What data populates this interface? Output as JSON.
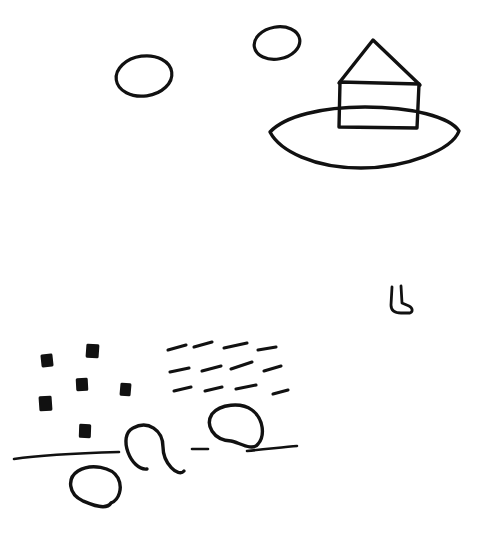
{
  "canvas": {
    "title": "Hand-drawn sketch",
    "width": 489,
    "height": 533,
    "background_color": "#ffffff",
    "ink_color": "#111111",
    "medium": "pencil-sketch"
  },
  "scene": {
    "description": "Rough pencil sketch: a house on an island-like oval in the upper right, two small clouds floating to its left, a small boot shape in the middle right, and a lower-left group of small filled squares, three rows of short dashes, three open circles and horizontal ground lines."
  },
  "shapes": {
    "cloud_left": {
      "name": "cloud-left",
      "cx": 144,
      "cy": 76,
      "rx": 28,
      "ry": 20,
      "rotate": -8,
      "stroke_width": 3.2
    },
    "cloud_right": {
      "name": "cloud-right",
      "cx": 277,
      "cy": 43,
      "rx": 23,
      "ry": 16,
      "rotate": -10,
      "stroke_width": 3.2
    },
    "island_oval": {
      "name": "island-oval",
      "path": "M 270 132 C 285 116 322 107 365 107 C 412 107 450 117 459 131 C 452 150 406 168 361 168 C 314 168 280 151 270 132 Z",
      "stroke_width": 3.4
    },
    "house_body": {
      "name": "house-body",
      "path": "M 340 82 L 419 84 L 417 128 L 339 127 Z",
      "stroke_width": 3.4
    },
    "house_roof": {
      "name": "house-roof",
      "path": "M 339 83 L 373 40 L 420 85",
      "stroke_width": 3.4
    },
    "boot": {
      "name": "boot-shape",
      "path": "M 392 287 L 391 305 C 391 311 395 313 401 313 L 410 313 C 413 312 413 308 409 306 L 402 303 L 401 286",
      "stroke_width": 2.8
    },
    "squares": [
      {
        "name": "square-1",
        "x": 41,
        "y": 354,
        "w": 12,
        "h": 13,
        "rotate": -6
      },
      {
        "name": "square-2",
        "x": 86,
        "y": 344,
        "w": 13,
        "h": 14,
        "rotate": 4
      },
      {
        "name": "square-3",
        "x": 76,
        "y": 378,
        "w": 12,
        "h": 13,
        "rotate": -3
      },
      {
        "name": "square-4",
        "x": 120,
        "y": 383,
        "w": 11,
        "h": 13,
        "rotate": 5
      },
      {
        "name": "square-5",
        "x": 39,
        "y": 396,
        "w": 13,
        "h": 15,
        "rotate": -4
      },
      {
        "name": "square-6",
        "x": 79,
        "y": 424,
        "w": 12,
        "h": 14,
        "rotate": 2
      }
    ],
    "dash_rows": [
      {
        "name": "dash-row-1",
        "dashes": [
          {
            "x1": 168,
            "y1": 350,
            "x2": 186,
            "y2": 345
          },
          {
            "x1": 194,
            "y1": 347,
            "x2": 212,
            "y2": 342
          },
          {
            "x1": 224,
            "y1": 348,
            "x2": 247,
            "y2": 343
          },
          {
            "x1": 258,
            "y1": 350,
            "x2": 276,
            "y2": 347
          }
        ]
      },
      {
        "name": "dash-row-2",
        "dashes": [
          {
            "x1": 170,
            "y1": 372,
            "x2": 189,
            "y2": 368
          },
          {
            "x1": 202,
            "y1": 371,
            "x2": 221,
            "y2": 366
          },
          {
            "x1": 231,
            "y1": 369,
            "x2": 252,
            "y2": 362
          },
          {
            "x1": 264,
            "y1": 371,
            "x2": 281,
            "y2": 366
          }
        ]
      },
      {
        "name": "dash-row-3",
        "dashes": [
          {
            "x1": 174,
            "y1": 391,
            "x2": 191,
            "y2": 387
          },
          {
            "x1": 205,
            "y1": 391,
            "x2": 222,
            "y2": 387
          },
          {
            "x1": 236,
            "y1": 389,
            "x2": 256,
            "y2": 385
          },
          {
            "x1": 273,
            "y1": 394,
            "x2": 288,
            "y2": 390
          }
        ]
      }
    ],
    "circles": [
      {
        "name": "circle-middle",
        "path": "M 184 471 C 178 478 163 463 163 447 C 163 430 148 420 133 428 C 117 436 131 471 147 469",
        "stroke_width": 3.4
      },
      {
        "name": "circle-upper-right",
        "path": "M 258 444 C 253 452 238 442 231 441 C 213 440 205 425 212 414 C 220 404 241 402 252 410 C 264 419 265 436 258 444",
        "stroke_width": 3.4
      },
      {
        "name": "circle-lower-left",
        "path": "M 111 503 C 106 511 90 504 83 501 C 68 494 67 478 78 471 C 91 463 112 467 118 478 C 123 488 119 500 111 503",
        "stroke_width": 3.4
      }
    ],
    "ground_lines": [
      {
        "name": "ground-line-left",
        "path": "M 14 459 C 40 455 82 453 119 452",
        "stroke_width": 2.6
      },
      {
        "name": "ground-line-dash-center",
        "path": "M 192 449 C 198 449 203 449 208 449",
        "stroke_width": 2.6
      },
      {
        "name": "ground-line-right",
        "path": "M 247 451 C 268 449 285 447 297 446",
        "stroke_width": 2.6
      }
    ]
  },
  "labels": {
    "canvas_label": "Sketch canvas",
    "house_label": "House on island",
    "cloud_label": "Cloud",
    "boot_label": "Boot",
    "squares_label": "Square marks",
    "dashes_label": "Dash marks",
    "circles_label": "Open circles",
    "lines_label": "Ground lines"
  }
}
